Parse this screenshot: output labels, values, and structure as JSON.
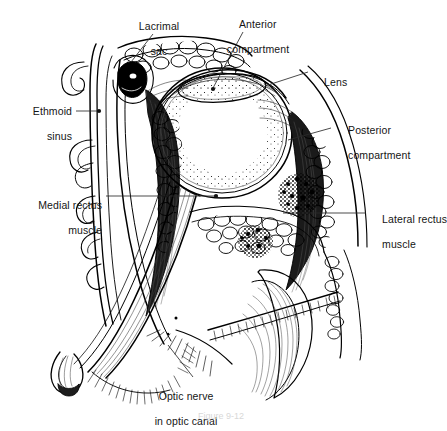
{
  "figure": {
    "caption": "Figure 9-12",
    "background_color": "#ffffff",
    "ink_color": "#000000",
    "label_color": "#151515",
    "leader_color": "#2a2a2a"
  },
  "labels": [
    {
      "id": "lacrimal-sac",
      "line1": "Lacrimal",
      "line2": "sac",
      "align": "center",
      "x": 110,
      "y": 8,
      "w": 86,
      "leader": "M153,34 L131,62",
      "endpoint": null
    },
    {
      "id": "anterior-compartment",
      "line1": "Anterior",
      "line2": "compartment",
      "align": "center",
      "x": 200,
      "y": 6,
      "w": 104,
      "leader": "M243,32 L213,88",
      "endpoint": [
        213,
        89
      ]
    },
    {
      "id": "lens",
      "line1": "Lens",
      "line2": "",
      "align": "left",
      "x": 312,
      "y": 64,
      "w": 60,
      "leader": "M308,72 L265,86",
      "endpoint": null
    },
    {
      "id": "posterior-compartment",
      "line1": "Posterior",
      "line2": "compartment",
      "align": "left",
      "x": 336,
      "y": 112,
      "w": 104,
      "leader": "M331,128 L288,140",
      "endpoint": null
    },
    {
      "id": "ethmoid-sinus",
      "line1": "Ethmoid",
      "line2": "sinus",
      "align": "right",
      "x": 4,
      "y": 93,
      "w": 68,
      "leader": "M76,111 L98,111",
      "endpoint": [
        99,
        111
      ]
    },
    {
      "id": "medial-rectus-muscle",
      "line1": "Medial rectus",
      "line2": "muscle",
      "align": "right",
      "x": 4,
      "y": 187,
      "w": 98,
      "leader": "M106,196 L215,196",
      "endpoint": [
        216,
        196
      ]
    },
    {
      "id": "lateral-rectus-muscle",
      "line1": "Lateral rectus",
      "line2": "muscle",
      "align": "left",
      "x": 370,
      "y": 201,
      "w": 72,
      "leader": "M366,213 L283,213",
      "endpoint": null
    },
    {
      "id": "optic-nerve-in-optic-canal",
      "line1": "Optic nerve",
      "line2": "in optic canal",
      "align": "center",
      "x": 128,
      "y": 378,
      "w": 104,
      "leader": "M193,377 L168,345",
      "endpoint": null
    }
  ]
}
